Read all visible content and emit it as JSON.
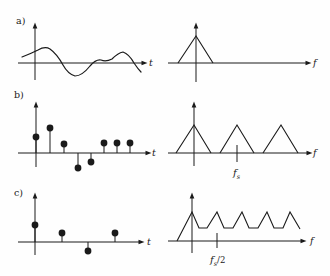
{
  "figure": {
    "width": 330,
    "height": 276,
    "ink": "#1a1a1a",
    "background": "#fefefe",
    "dot_radius": 3.4,
    "panels": [
      {
        "name": "a",
        "label": "a)",
        "label_xy": [
          16,
          24
        ],
        "plots": [
          {
            "name": "a-left-continuous-time-signal",
            "axes": [
              {
                "x1": 18,
                "y1": 63,
                "x2": 143,
                "y2": 63,
                "arrow": "right",
                "label": "t",
                "lx": 149,
                "ly": 66
              },
              {
                "x1": 35,
                "y1": 80,
                "x2": 35,
                "y2": 27,
                "arrow": "up"
              }
            ],
            "curve": "M22,57 Q30,54 38,50 Q45,46 50,49 Q57,54 63,65 Q68,74 75,76 Q82,76 90,66 Q96,59 101,60 Q106,62 112,59 Q118,53 123,52 Q129,54 134,63 Q138,69 141,72"
          },
          {
            "name": "a-right-baseband-spectrum",
            "axes": [
              {
                "x1": 168,
                "y1": 63,
                "x2": 307,
                "y2": 63,
                "arrow": "right",
                "label": "f",
                "lx": 313,
                "ly": 66
              },
              {
                "x1": 196,
                "y1": 82,
                "x2": 196,
                "y2": 27,
                "arrow": "up"
              }
            ],
            "polylines": [
              [
                [
                  178,
                  63
                ],
                [
                  196,
                  36
                ],
                [
                  213,
                  63
                ]
              ]
            ]
          }
        ]
      },
      {
        "name": "b",
        "label": "b)",
        "label_xy": [
          14,
          98
        ],
        "plots": [
          {
            "name": "b-left-sampled-signal",
            "axes": [
              {
                "x1": 18,
                "y1": 153,
                "x2": 147,
                "y2": 153,
                "arrow": "right",
                "label": "t",
                "lx": 152,
                "ly": 156
              },
              {
                "x1": 36,
                "y1": 167,
                "x2": 36,
                "y2": 106,
                "arrow": "up"
              }
            ],
            "stems": {
              "baseline": 153,
              "points": [
                [
                  36,
                  137
                ],
                [
                  50,
                  128
                ],
                [
                  64,
                  144
                ],
                [
                  78,
                  168
                ],
                [
                  91,
                  162
                ],
                [
                  104,
                  143
                ],
                [
                  117,
                  143
                ],
                [
                  130,
                  143
                ]
              ]
            }
          },
          {
            "name": "b-right-replicated-spectrum",
            "axes": [
              {
                "x1": 168,
                "y1": 153,
                "x2": 308,
                "y2": 153,
                "arrow": "right",
                "label": "f",
                "lx": 313,
                "ly": 156
              },
              {
                "x1": 194,
                "y1": 166,
                "x2": 194,
                "y2": 106,
                "arrow": "up"
              }
            ],
            "polylines": [
              [
                [
                  176,
                  153
                ],
                [
                  194,
                  125
                ],
                [
                  211,
                  153
                ]
              ],
              [
                [
                  220,
                  153
                ],
                [
                  237,
                  125
                ],
                [
                  254,
                  153
                ]
              ],
              [
                [
                  263,
                  153
                ],
                [
                  281,
                  125
                ],
                [
                  298,
                  153
                ]
              ]
            ],
            "ticks": [
              {
                "x": 237,
                "y1": 145,
                "y2": 162,
                "lx": 233,
                "ly": 176,
                "label": {
                  "main": "f",
                  "sub": "s",
                  "suffix": ""
                }
              }
            ]
          }
        ]
      },
      {
        "name": "c",
        "label": "c)",
        "label_xy": [
          14,
          196
        ],
        "plots": [
          {
            "name": "c-left-undersampled-signal",
            "axes": [
              {
                "x1": 18,
                "y1": 242,
                "x2": 140,
                "y2": 242,
                "arrow": "right",
                "label": "t",
                "lx": 147,
                "ly": 245
              },
              {
                "x1": 35,
                "y1": 255,
                "x2": 35,
                "y2": 197,
                "arrow": "up"
              }
            ],
            "stems": {
              "baseline": 242,
              "points": [
                [
                  35,
                  225
                ],
                [
                  62,
                  233
                ],
                [
                  88,
                  251
                ],
                [
                  115,
                  233
                ]
              ]
            }
          },
          {
            "name": "c-right-aliased-spectrum",
            "axes": [
              {
                "x1": 168,
                "y1": 241,
                "x2": 302,
                "y2": 241,
                "arrow": "right",
                "label": "f",
                "lx": 310,
                "ly": 244
              },
              {
                "x1": 192,
                "y1": 253,
                "x2": 192,
                "y2": 197,
                "arrow": "up"
              }
            ],
            "polylines": [
              [
                [
                  177,
                  241
                ],
                [
                  192,
                  212
                ],
                [
                  199,
                  228
                ],
                [
                  207,
                  228
                ],
                [
                  217,
                  212
                ],
                [
                  224,
                  228
                ],
                [
                  233,
                  228
                ],
                [
                  242,
                  212
                ],
                [
                  249,
                  228
                ],
                [
                  258,
                  228
                ],
                [
                  267,
                  212
                ],
                [
                  274,
                  228
                ],
                [
                  283,
                  228
                ],
                [
                  290,
                  212
                ],
                [
                  300,
                  229
                ]
              ]
            ],
            "ticks": [
              {
                "x": 217,
                "y1": 233,
                "y2": 248,
                "lx": 210,
                "ly": 263,
                "label": {
                  "main": "f",
                  "sub": "s",
                  "suffix": "/2"
                }
              }
            ]
          }
        ]
      }
    ]
  }
}
